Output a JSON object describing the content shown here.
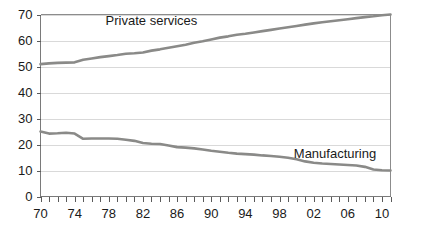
{
  "chart_data": {
    "type": "line",
    "title": "",
    "xlabel": "",
    "ylabel": "",
    "xlim": [
      1970,
      2011
    ],
    "ylim": [
      0,
      70
    ],
    "ytick_step": 10,
    "yticks": [
      0,
      10,
      20,
      30,
      40,
      50,
      60,
      70
    ],
    "ytick_labels": [
      "0",
      "10",
      "20",
      "30",
      "40",
      "50",
      "60",
      "70"
    ],
    "x_minor_tick_every_years": 1,
    "x_label_every_years": 4,
    "xticks": [
      1970,
      1974,
      1978,
      1982,
      1986,
      1990,
      1994,
      1998,
      2002,
      2006,
      2010
    ],
    "xtick_labels": [
      "70",
      "74",
      "78",
      "82",
      "86",
      "90",
      "94",
      "98",
      "02",
      "06",
      "10"
    ],
    "grid": "horizontal",
    "legend_position": "inline-annotation",
    "line_color": "#8a8a88",
    "gridline_color": "#d9d9d9",
    "border_color": "#8c8c8c",
    "background_color": "#ffffff",
    "x": [
      1970,
      1971,
      1972,
      1973,
      1974,
      1975,
      1976,
      1977,
      1978,
      1979,
      1980,
      1981,
      1982,
      1983,
      1984,
      1985,
      1986,
      1987,
      1988,
      1989,
      1990,
      1991,
      1992,
      1993,
      1994,
      1995,
      1996,
      1997,
      1998,
      1999,
      2000,
      2001,
      2002,
      2003,
      2004,
      2005,
      2006,
      2007,
      2008,
      2009,
      2010,
      2011
    ],
    "series": [
      {
        "name": "Private services",
        "label": "Private services",
        "color": "#8a8a88",
        "values": [
          50.9,
          51.2,
          51.4,
          51.5,
          51.6,
          52.6,
          53.1,
          53.6,
          54.0,
          54.4,
          54.9,
          55.1,
          55.4,
          56.1,
          56.6,
          57.2,
          57.8,
          58.4,
          59.1,
          59.7,
          60.4,
          61.1,
          61.6,
          62.2,
          62.6,
          63.1,
          63.6,
          64.1,
          64.6,
          65.1,
          65.6,
          66.1,
          66.6,
          67.0,
          67.4,
          67.8,
          68.2,
          68.6,
          69.0,
          69.3,
          69.7,
          70.0
        ]
      },
      {
        "name": "Manufacturing",
        "label": "Manufacturing",
        "color": "#8a8a88",
        "values": [
          25.0,
          24.2,
          24.3,
          24.5,
          24.2,
          22.2,
          22.3,
          22.3,
          22.3,
          22.2,
          21.8,
          21.4,
          20.6,
          20.3,
          20.2,
          19.6,
          19.0,
          18.8,
          18.5,
          18.1,
          17.6,
          17.2,
          16.8,
          16.5,
          16.3,
          16.1,
          15.8,
          15.6,
          15.3,
          14.9,
          14.3,
          13.5,
          13.0,
          12.7,
          12.5,
          12.3,
          12.1,
          11.9,
          11.4,
          10.4,
          10.1,
          10.0
        ]
      }
    ],
    "annotations": [
      {
        "text": "Private services",
        "x": 1983.0,
        "y": 66.0
      },
      {
        "text": "Manufacturing",
        "x": 2004.5,
        "y": 15.0
      }
    ]
  }
}
